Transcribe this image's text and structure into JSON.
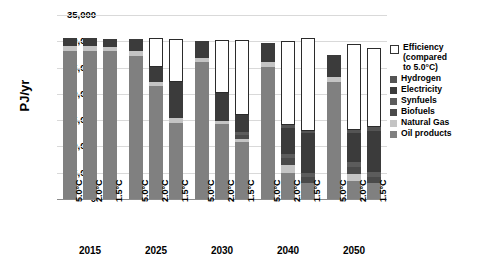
{
  "chart_data": {
    "type": "bar",
    "stacked": true,
    "title": "",
    "xlabel": "",
    "ylabel": "PJ/yr",
    "ylim": [
      0,
      35000
    ],
    "ytick_values": [
      0,
      5000,
      10000,
      15000,
      20000,
      25000,
      30000,
      35000
    ],
    "ytick_labels": [
      "0",
      "5,000",
      "10,000",
      "15,000",
      "20,000",
      "25,000",
      "30,000",
      "35,000"
    ],
    "grid": true,
    "legend_position": "right",
    "group_labels": [
      "2015",
      "2025",
      "2030",
      "2040",
      "2050"
    ],
    "scenario_labels": [
      "5.0°C",
      "2.0°C",
      "1.5°C"
    ],
    "series": [
      {
        "name": "Oil products",
        "color": "#808080",
        "values": [
          28200,
          28150,
          28100,
          27200,
          21500,
          14500,
          26000,
          14200,
          10800,
          25200,
          5000,
          3000,
          22300,
          3500,
          3000
        ]
      },
      {
        "name": "Natural Gas",
        "color": "#c4c4c4",
        "values": [
          900,
          900,
          900,
          900,
          700,
          900,
          900,
          700,
          600,
          900,
          1500,
          0,
          900,
          1200,
          0
        ]
      },
      {
        "name": "Biofuels",
        "color": "#4a4a4a",
        "values": [
          0,
          0,
          0,
          0,
          0,
          0,
          0,
          0,
          700,
          0,
          1300,
          1200,
          0,
          1400,
          1200
        ]
      },
      {
        "name": "Synfuels",
        "color": "#5c5c5c",
        "values": [
          0,
          0,
          0,
          0,
          0,
          0,
          0,
          0,
          600,
          0,
          700,
          800,
          0,
          900,
          900
        ]
      },
      {
        "name": "Electricity",
        "color": "#3b3b3b",
        "values": [
          1500,
          1500,
          1500,
          2400,
          3000,
          6900,
          3100,
          5200,
          3200,
          3500,
          5000,
          7500,
          4200,
          5500,
          7800
        ]
      },
      {
        "name": "Hydrogen",
        "color": "#545454",
        "values": [
          0,
          0,
          0,
          0,
          0,
          0,
          0,
          0,
          0,
          0,
          500,
          500,
          0,
          600,
          800
        ]
      },
      {
        "name": "Efficiency (compared to 5.0°C)",
        "color": "#ffffff",
        "values": [
          0,
          0,
          0,
          0,
          5400,
          8100,
          0,
          10200,
          14400,
          0,
          16100,
          17600,
          0,
          16400,
          15000
        ]
      }
    ],
    "bars": [
      {
        "group": "2015",
        "scenario": "5.0°C",
        "total": 30600
      },
      {
        "group": "2015",
        "scenario": "2.0°C",
        "total": 30550
      },
      {
        "group": "2015",
        "scenario": "1.5°C",
        "total": 30500
      },
      {
        "group": "2025",
        "scenario": "5.0°C",
        "total": 30500
      },
      {
        "group": "2025",
        "scenario": "2.0°C",
        "total": 30600
      },
      {
        "group": "2025",
        "scenario": "1.5°C",
        "total": 30400
      },
      {
        "group": "2030",
        "scenario": "5.0°C",
        "total": 30000
      },
      {
        "group": "2030",
        "scenario": "2.0°C",
        "total": 30300
      },
      {
        "group": "2030",
        "scenario": "1.5°C",
        "total": 30300
      },
      {
        "group": "2040",
        "scenario": "5.0°C",
        "total": 29600
      },
      {
        "group": "2040",
        "scenario": "2.0°C",
        "total": 30100
      },
      {
        "group": "2040",
        "scenario": "1.5°C",
        "total": 30600
      },
      {
        "group": "2050",
        "scenario": "5.0°C",
        "total": 27400
      },
      {
        "group": "2050",
        "scenario": "2.0°C",
        "total": 29500
      },
      {
        "group": "2050",
        "scenario": "1.5°C",
        "total": 28700
      }
    ]
  },
  "legend": {
    "items": [
      {
        "label": "Efficiency",
        "label2": "(compared",
        "label3": "to 5.0°C)",
        "key": "eff"
      },
      {
        "label": "Hydrogen",
        "key": "hyd"
      },
      {
        "label": "Electricity",
        "key": "ele"
      },
      {
        "label": "Synfuels",
        "key": "syn"
      },
      {
        "label": "Biofuels",
        "key": "bio"
      },
      {
        "label": "Natural Gas",
        "key": "gas"
      },
      {
        "label": "Oil products",
        "key": "oil"
      }
    ]
  }
}
